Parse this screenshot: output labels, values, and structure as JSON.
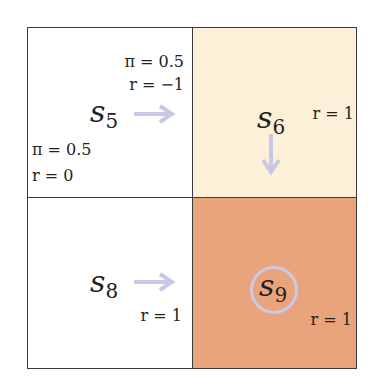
{
  "colors": {
    "s5_fill": "#ffffff",
    "s6_fill": "#fdf0d8",
    "s8_fill": "#ffffff",
    "s9_fill": "#e9a47b",
    "arrow": "#c6c8e4",
    "border": "#3a3a3a"
  },
  "cells": {
    "s5": {
      "symbol": "s",
      "index": "5",
      "right_policy": "π = 0.5",
      "right_reward": "r = −1",
      "down_policy": "π = 0.5",
      "down_reward": "r = 0",
      "arrow": "right-arrow"
    },
    "s6": {
      "symbol": "s",
      "index": "6",
      "reward": "r = 1",
      "arrow": "down-arrow"
    },
    "s8": {
      "symbol": "s",
      "index": "8",
      "reward": "r = 1",
      "arrow": "right-arrow"
    },
    "s9": {
      "symbol": "s",
      "index": "9",
      "reward": "r = 1",
      "marker": "target-circle"
    }
  }
}
